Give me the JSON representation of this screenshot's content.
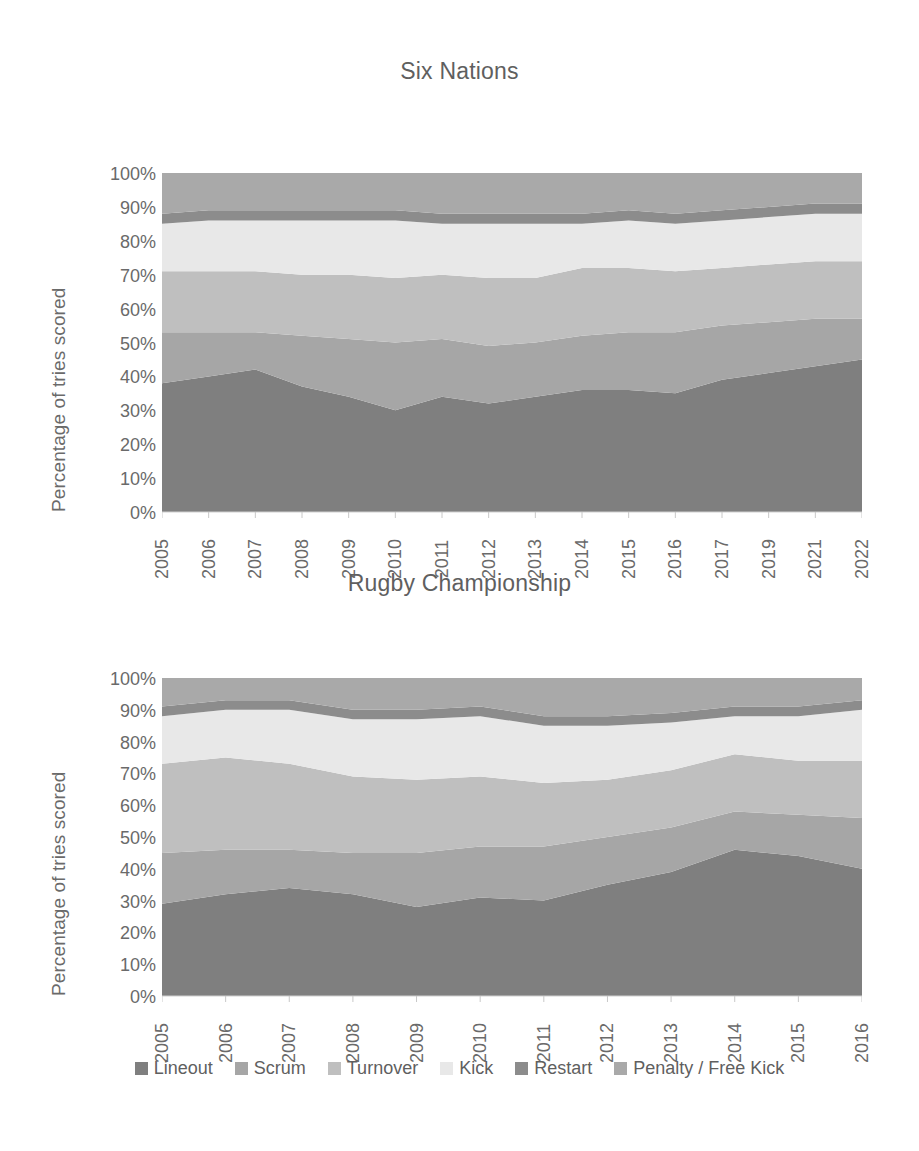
{
  "page": {
    "background": "#ffffff",
    "text_color": "#5f5f5f"
  },
  "legend": {
    "position": "bottom-center",
    "items": [
      {
        "label": "Lineout",
        "color": "#7f7f7f"
      },
      {
        "label": "Scrum",
        "color": "#a6a6a6"
      },
      {
        "label": "Turnover",
        "color": "#bfbfbf"
      },
      {
        "label": "Kick",
        "color": "#e8e8e8"
      },
      {
        "label": "Restart",
        "color": "#8c8c8c"
      },
      {
        "label": "Penalty / Free Kick",
        "color": "#a9a9a9"
      }
    ]
  },
  "axis": {
    "ylabel": "Percentage of tries scored",
    "yticks": [
      "100%",
      "90%",
      "80%",
      "70%",
      "60%",
      "50%",
      "40%",
      "30%",
      "20%",
      "10%",
      "0%"
    ]
  },
  "chart_data": [
    {
      "type": "area",
      "stacked": true,
      "stack_total": 100,
      "title": "Six Nations",
      "xlabel": "",
      "ylabel": "Percentage of tries scored",
      "ylim": [
        0,
        100
      ],
      "grid": false,
      "legend_position": "bottom",
      "categories": [
        "2005",
        "2006",
        "2007",
        "2008",
        "2009",
        "2010",
        "2011",
        "2012",
        "2013",
        "2014",
        "2015",
        "2016",
        "2017",
        "2019",
        "2021",
        "2022"
      ],
      "series": [
        {
          "name": "Lineout",
          "color": "#7f7f7f",
          "values": [
            38,
            40,
            42,
            37,
            34,
            30,
            34,
            32,
            34,
            36,
            36,
            35,
            39,
            41,
            43,
            45
          ]
        },
        {
          "name": "Scrum",
          "color": "#a6a6a6",
          "values": [
            15,
            13,
            11,
            15,
            17,
            20,
            17,
            17,
            16,
            16,
            17,
            18,
            16,
            15,
            14,
            12
          ]
        },
        {
          "name": "Turnover",
          "color": "#bfbfbf",
          "values": [
            18,
            18,
            18,
            18,
            19,
            19,
            19,
            20,
            19,
            20,
            19,
            18,
            17,
            17,
            17,
            17
          ]
        },
        {
          "name": "Kick",
          "color": "#e8e8e8",
          "values": [
            14,
            15,
            15,
            16,
            16,
            17,
            15,
            16,
            16,
            13,
            14,
            14,
            14,
            14,
            14,
            14
          ]
        },
        {
          "name": "Restart",
          "color": "#8c8c8c",
          "values": [
            3,
            3,
            3,
            3,
            3,
            3,
            3,
            3,
            3,
            3,
            3,
            3,
            3,
            3,
            3,
            3
          ]
        },
        {
          "name": "Penalty / Free Kick",
          "color": "#a9a9a9",
          "values": [
            12,
            11,
            11,
            11,
            11,
            11,
            12,
            12,
            12,
            12,
            11,
            12,
            11,
            10,
            9,
            9
          ]
        }
      ]
    },
    {
      "type": "area",
      "stacked": true,
      "stack_total": 100,
      "title": "Rugby Championship",
      "xlabel": "",
      "ylabel": "Percentage of tries scored",
      "ylim": [
        0,
        100
      ],
      "grid": false,
      "legend_position": "bottom",
      "categories": [
        "2005",
        "2006",
        "2007",
        "2008",
        "2009",
        "2010",
        "2011",
        "2012",
        "2013",
        "2014",
        "2015",
        "2016"
      ],
      "series": [
        {
          "name": "Lineout",
          "color": "#7f7f7f",
          "values": [
            29,
            32,
            34,
            32,
            28,
            31,
            30,
            35,
            39,
            46,
            44,
            40
          ]
        },
        {
          "name": "Scrum",
          "color": "#a6a6a6",
          "values": [
            16,
            14,
            12,
            13,
            17,
            16,
            17,
            15,
            14,
            12,
            13,
            16
          ]
        },
        {
          "name": "Turnover",
          "color": "#bfbfbf",
          "values": [
            28,
            29,
            27,
            24,
            23,
            22,
            20,
            18,
            18,
            18,
            17,
            18
          ]
        },
        {
          "name": "Kick",
          "color": "#e8e8e8",
          "values": [
            15,
            15,
            17,
            18,
            19,
            19,
            18,
            17,
            15,
            12,
            14,
            16
          ]
        },
        {
          "name": "Restart",
          "color": "#8c8c8c",
          "values": [
            3,
            3,
            3,
            3,
            3,
            3,
            3,
            3,
            3,
            3,
            3,
            3
          ]
        },
        {
          "name": "Penalty / Free Kick",
          "color": "#a9a9a9",
          "values": [
            9,
            7,
            7,
            10,
            10,
            9,
            12,
            12,
            11,
            9,
            9,
            7
          ]
        }
      ]
    }
  ],
  "layout": {
    "chart_one": {
      "plot_left": 162,
      "plot_top": 127,
      "plot_width": 700,
      "plot_height": 339
    },
    "chart_two": {
      "plot_left": 162,
      "plot_top": 640,
      "plot_width": 700,
      "plot_height": 318
    }
  }
}
